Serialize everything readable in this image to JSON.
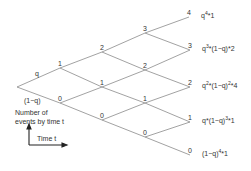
{
  "diagram": {
    "type": "binomial-tree",
    "branch_labels": {
      "up": "q",
      "down": "(1−q)"
    },
    "nodes": {
      "root": {
        "x": 17,
        "y": 87,
        "label": ""
      },
      "level1": [
        {
          "x": 60,
          "y": 68,
          "label": "1"
        },
        {
          "x": 60,
          "y": 103,
          "label": "0"
        }
      ],
      "level2": [
        {
          "x": 102,
          "y": 52,
          "label": "2"
        },
        {
          "x": 102,
          "y": 87,
          "label": "1"
        },
        {
          "x": 102,
          "y": 120,
          "label": "0"
        }
      ],
      "level3": [
        {
          "x": 145,
          "y": 33,
          "label": "3"
        },
        {
          "x": 145,
          "y": 70,
          "label": "2"
        },
        {
          "x": 145,
          "y": 103,
          "label": "1"
        },
        {
          "x": 145,
          "y": 137,
          "label": "0"
        }
      ],
      "level4": [
        {
          "x": 189,
          "y": 17,
          "label": "4"
        },
        {
          "x": 190,
          "y": 50,
          "label": "3"
        },
        {
          "x": 190,
          "y": 87,
          "label": "2"
        },
        {
          "x": 190,
          "y": 122,
          "label": "1"
        },
        {
          "x": 190,
          "y": 155,
          "label": "0"
        }
      ]
    },
    "leaf_probabilities": [
      {
        "base": "q",
        "exp": "4",
        "rest": "*1"
      },
      {
        "base": "q",
        "exp": "3",
        "rest": "*(1−q)*2"
      },
      {
        "base": "q",
        "exp": "2",
        "rest": "*(1−q)",
        "exp2": "2",
        "rest2": "*4"
      },
      {
        "base": "q",
        "exp": "",
        "rest": "*(1−q)",
        "exp2": "3",
        "rest2": "*1"
      },
      {
        "base": "(1−q)",
        "exp": "4",
        "rest": "*1"
      }
    ],
    "legend": {
      "y_axis_label_line1": "Number of",
      "y_axis_label_line2": "events by time t",
      "x_axis_label": "Time t"
    },
    "colors": {
      "line": "#8a8a8a",
      "text": "#333333",
      "axis": "#222222"
    }
  }
}
